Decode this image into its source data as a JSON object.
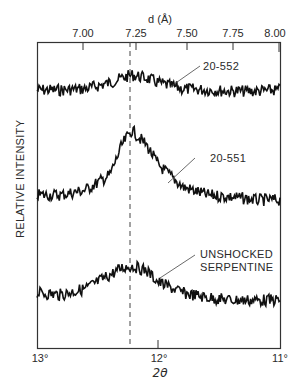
{
  "chart_data": {
    "type": "line",
    "title": "",
    "xlabel": "2θ",
    "ylabel": "RELATIVE INTENSITY",
    "x_axis_bottom": {
      "label": "2θ",
      "ticks": [
        "13°",
        "12°",
        "11°"
      ],
      "tick_values": [
        13,
        12,
        11
      ],
      "range": [
        13,
        11
      ]
    },
    "x_axis_top": {
      "label": "d (Å)",
      "ticks": [
        "7.00",
        "7.25",
        "7.50",
        "7.75",
        "8.00"
      ],
      "tick_values": [
        7.0,
        7.25,
        7.5,
        7.75,
        8.0
      ]
    },
    "reference_line": {
      "style": "dashed",
      "two_theta": 12.22,
      "d_angstrom": 7.23
    },
    "grid": false,
    "legend": "inline labels with leader lines",
    "x": [
      13.0,
      12.8,
      12.6,
      12.4,
      12.3,
      12.22,
      12.1,
      12.0,
      11.8,
      11.6,
      11.4,
      11.2,
      11.0
    ],
    "series": [
      {
        "name": "20-552",
        "values": [
          0.3,
          0.3,
          0.32,
          0.42,
          0.5,
          0.55,
          0.5,
          0.42,
          0.32,
          0.3,
          0.28,
          0.28,
          0.3
        ]
      },
      {
        "name": "20-551",
        "values": [
          0.2,
          0.2,
          0.25,
          0.4,
          0.7,
          0.85,
          0.7,
          0.5,
          0.28,
          0.2,
          0.18,
          0.15,
          0.15
        ]
      },
      {
        "name": "UNSHOCKED SERPENTINE",
        "values": [
          0.3,
          0.28,
          0.35,
          0.5,
          0.58,
          0.6,
          0.55,
          0.42,
          0.3,
          0.25,
          0.22,
          0.22,
          0.22
        ]
      }
    ]
  },
  "labels": {
    "top_axis_title": "d (Å)",
    "bottom_axis_title": "2θ",
    "y_axis_title": "RELATIVE INTENSITY",
    "series_1": "20-552",
    "series_2": "20-551",
    "series_3_line1": "UNSHOCKED",
    "series_3_line2": "SERPENTINE",
    "top_ticks": [
      "7.00",
      "7.25",
      "7.50",
      "7.75",
      "8.00"
    ],
    "bottom_ticks": [
      "13°",
      "12°",
      "11°"
    ]
  }
}
